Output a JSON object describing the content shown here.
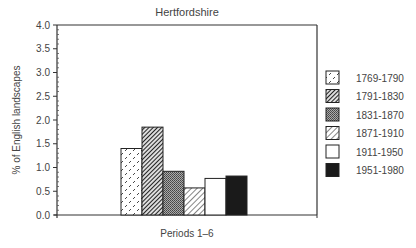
{
  "chart_data": {
    "type": "bar",
    "title": "Hertfordshire",
    "xlabel": "Periods 1–6",
    "ylabel": "% of English landscapes",
    "ylim": [
      0,
      4.0
    ],
    "yticks": [
      "0.0",
      "0.5",
      "1.0",
      "1.5",
      "2.0",
      "2.5",
      "3.0",
      "3.5",
      "4.0"
    ],
    "grid": false,
    "legend_position": "right",
    "categories": [
      "1769-1790",
      "1791-1830",
      "1831-1870",
      "1871-1910",
      "1911-1950",
      "1951-1980"
    ],
    "values": [
      1.4,
      1.85,
      0.92,
      0.57,
      0.77,
      0.82
    ],
    "series": [
      {
        "name": "1769-1790",
        "value": 1.4,
        "pattern": "dashes-light"
      },
      {
        "name": "1791-1830",
        "value": 1.85,
        "pattern": "hatch-dense-dark"
      },
      {
        "name": "1831-1870",
        "value": 0.92,
        "pattern": "stipple-grey"
      },
      {
        "name": "1871-1910",
        "value": 0.57,
        "pattern": "hatch-light"
      },
      {
        "name": "1911-1950",
        "value": 0.77,
        "pattern": "white"
      },
      {
        "name": "1951-1980",
        "value": 0.82,
        "pattern": "solid-black"
      }
    ]
  }
}
